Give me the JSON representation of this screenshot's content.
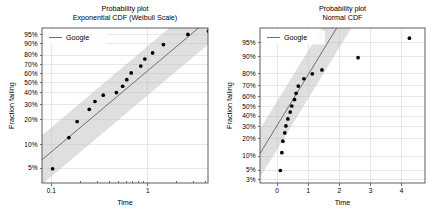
{
  "figure": {
    "background": "#ffffff",
    "accent_line_color": "#6f6f6f",
    "point_color": "#000000",
    "band_color": "#bdbdbd",
    "grid_color": "#cfd6e4"
  },
  "chart_data": [
    {
      "id": "left",
      "type": "scatter",
      "title": "Probability plot",
      "subtitle": "Exponential CDF (Weibull Scale)",
      "xlabel": "Time",
      "ylabel": "Fraction failing",
      "grid": true,
      "legend": {
        "position": "upper left",
        "entries": [
          "Google"
        ]
      },
      "xscale": "log",
      "yscale": "weibull-probability",
      "xlim": [
        0.08,
        4.2
      ],
      "xticks": [
        0.1,
        1
      ],
      "xticklabels": [
        "0.1",
        "1"
      ],
      "yticks": [
        5,
        10,
        20,
        30,
        40,
        50,
        60,
        70,
        80,
        90,
        95
      ],
      "yticklabels": [
        "5%",
        "10%",
        "20%",
        "30%",
        "40%",
        "50%",
        "60%",
        "70%",
        "80%",
        "90%",
        "95%"
      ],
      "ylim": [
        3.2,
        97.5
      ],
      "series": [
        {
          "name": "Google",
          "x": [
            0.103,
            0.152,
            0.185,
            0.247,
            0.283,
            0.345,
            0.472,
            0.548,
            0.605,
            0.672,
            0.845,
            0.93,
            1.12,
            1.45,
            2.6,
            4.25
          ],
          "y": [
            4.9,
            12.2,
            19.1,
            26.5,
            32.4,
            37.8,
            40.2,
            46.4,
            53.3,
            60.8,
            68.5,
            76.1,
            82.2,
            89.2,
            95.2,
            96.5
          ]
        }
      ],
      "fit_line": {
        "name": "Google",
        "x": [
          0.08,
          4.2
        ],
        "y": [
          6.4,
          99.1
        ]
      },
      "confidence_band": {
        "level": "approx",
        "lower_offset": -7.5,
        "upper_offset": 7.5
      }
    },
    {
      "id": "right",
      "type": "scatter",
      "title": "Probability plot",
      "subtitle": "Normal CDF",
      "xlabel": "Time",
      "ylabel": "Fraction failing",
      "grid": true,
      "legend": {
        "position": "upper left",
        "entries": [
          "Google"
        ]
      },
      "xscale": "linear",
      "yscale": "normal-probability",
      "xlim": [
        -0.55,
        4.75
      ],
      "xticks": [
        0,
        1,
        2,
        3,
        4
      ],
      "xticklabels": [
        "0",
        "1",
        "2",
        "3",
        "4"
      ],
      "yticks": [
        3,
        5,
        10,
        20,
        30,
        40,
        50,
        60,
        70,
        80,
        90,
        95
      ],
      "yticklabels": [
        "3%",
        "5%",
        "10%",
        "20%",
        "30%",
        "40%",
        "50%",
        "60%",
        "70%",
        "80%",
        "90%",
        "95%"
      ],
      "ylim": [
        2.4,
        97.8
      ],
      "series": [
        {
          "name": "Google",
          "x": [
            0.103,
            0.152,
            0.185,
            0.247,
            0.283,
            0.345,
            0.42,
            0.47,
            0.56,
            0.61,
            0.68,
            0.86,
            1.13,
            1.44,
            2.6,
            4.25
          ],
          "y": [
            4.9,
            11.6,
            18.4,
            24.6,
            30.6,
            37.2,
            44.0,
            50.2,
            56.8,
            63.0,
            69.8,
            76.0,
            79.8,
            82.5,
            89.4,
            96.0
          ]
        }
      ],
      "fit_line": {
        "name": "Google",
        "x": [
          -0.55,
          2.25
        ],
        "y": [
          11.2,
          99.3
        ]
      },
      "confidence_band": {
        "level": "approx",
        "lower_offset": -0.62,
        "upper_offset": 0.62
      }
    }
  ]
}
